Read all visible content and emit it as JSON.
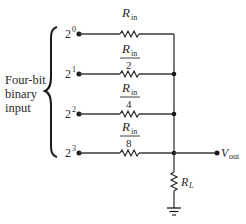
{
  "diagram": {
    "group_label": [
      "Four-bit",
      "binary",
      "input"
    ],
    "inputs": [
      {
        "base": "2",
        "exp": "0",
        "resistor_num": "R",
        "resistor_sub": "in",
        "resistor_den": ""
      },
      {
        "base": "2",
        "exp": "1",
        "resistor_num": "R",
        "resistor_sub": "in",
        "resistor_den": "2"
      },
      {
        "base": "2",
        "exp": "2",
        "resistor_num": "R",
        "resistor_sub": "in",
        "resistor_den": "4"
      },
      {
        "base": "2",
        "exp": "3",
        "resistor_num": "R",
        "resistor_sub": "in",
        "resistor_den": "8"
      }
    ],
    "output": {
      "label": "V",
      "sub": "out"
    },
    "load": {
      "label": "R",
      "sub": "L"
    },
    "colors": {
      "line": "#3a3a3a",
      "text": "#2a2a2a",
      "background": "#ffffff"
    }
  }
}
